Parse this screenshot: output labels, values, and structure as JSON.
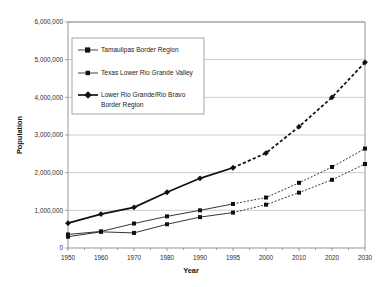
{
  "chart_data": {
    "type": "line",
    "title": "",
    "xlabel": "Year",
    "ylabel": "Population",
    "categories": [
      "1950",
      "1960",
      "1970",
      "1980",
      "1990",
      "1995",
      "2000",
      "2010",
      "2020",
      "2030"
    ],
    "ylim": [
      0,
      6000000
    ],
    "ytick_values": [
      0,
      1000000,
      2000000,
      3000000,
      4000000,
      5000000,
      6000000
    ],
    "ytick_labels": [
      "0",
      "1,000,000",
      "2,000,000",
      "3,000,000",
      "4,000,000",
      "5,000,000",
      "6,000,000"
    ],
    "grid": "horizontal",
    "legend_position": "upper-left-inside",
    "historical_through": "1995",
    "projection_note": "dashed segments from 1995 onward are projections",
    "series": [
      {
        "name": "Tamaulipas Border Region",
        "marker": "square",
        "line_weight": "thin",
        "values": [
          300000,
          430000,
          400000,
          630000,
          820000,
          940000,
          1150000,
          1470000,
          1810000,
          2230000
        ]
      },
      {
        "name": "Texas Lower Rio Grande Valley",
        "marker": "square",
        "line_weight": "thin",
        "values": [
          360000,
          440000,
          650000,
          840000,
          1000000,
          1170000,
          1340000,
          1730000,
          2150000,
          2640000
        ]
      },
      {
        "name": "Lower Rio Grande/Rio Bravo Border Region",
        "marker": "diamond",
        "line_weight": "thick",
        "values": [
          660000,
          900000,
          1080000,
          1480000,
          1850000,
          2130000,
          2520000,
          3220000,
          4000000,
          4930000
        ]
      }
    ]
  },
  "legend": {
    "entries": [
      {
        "label": "Tamaulipas Border Region"
      },
      {
        "label": "Texas Lower Rio Grande Valley"
      },
      {
        "label": "Lower Rio Grande/Rio Bravo",
        "label2": "Border Region"
      }
    ]
  },
  "colors": {
    "line": "#111111",
    "grid": "#9a9a9a",
    "frame": "#6b6b6b",
    "background": "#ffffff"
  }
}
